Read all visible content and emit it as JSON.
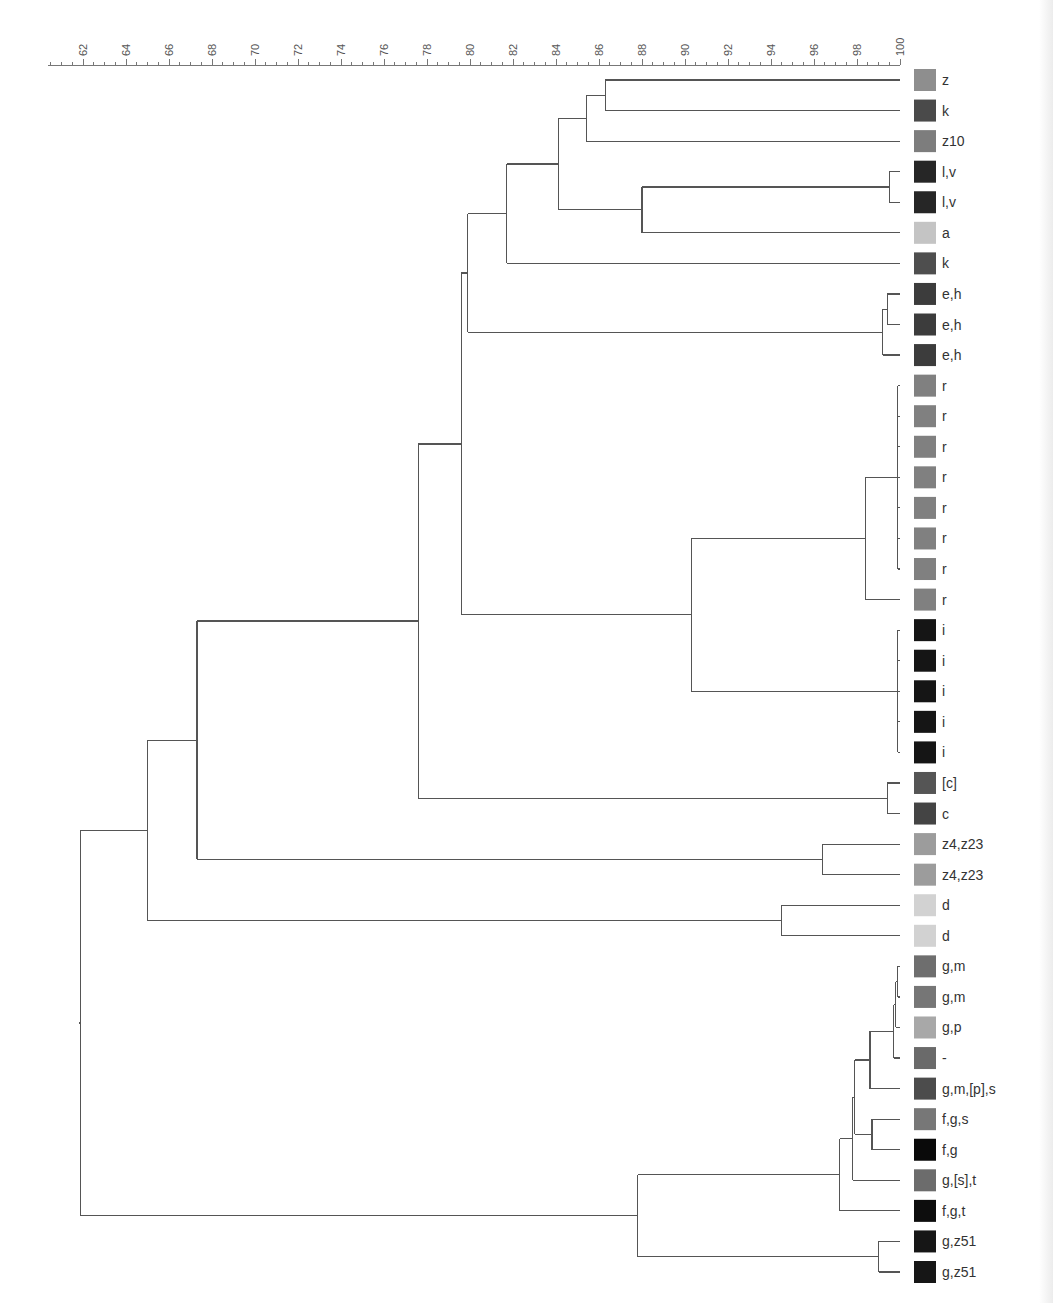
{
  "chart_data": {
    "type": "dendrogram",
    "title": "",
    "xlabel": "",
    "ylabel": "",
    "axis": {
      "min": 62,
      "max": 100,
      "major_ticks": [
        62,
        64,
        66,
        68,
        70,
        72,
        74,
        76,
        78,
        80,
        82,
        84,
        86,
        88,
        90,
        92,
        94,
        96,
        98,
        100
      ],
      "minor_step": 0.5,
      "position": "top",
      "label_rotation": -90
    },
    "grid": false,
    "legend": "color swatches beside leaf labels",
    "leaves": [
      {
        "label": "z",
        "color": "#8e8e8e"
      },
      {
        "label": "k",
        "color": "#4a4a4a"
      },
      {
        "label": "z10",
        "color": "#7d7d7d"
      },
      {
        "label": "l,v",
        "color": "#262626"
      },
      {
        "label": "l,v",
        "color": "#262626"
      },
      {
        "label": "a",
        "color": "#c4c4c4"
      },
      {
        "label": "k",
        "color": "#4e4e4e"
      },
      {
        "label": "e,h",
        "color": "#3c3c3c"
      },
      {
        "label": "e,h",
        "color": "#3c3c3c"
      },
      {
        "label": "e,h",
        "color": "#3c3c3c"
      },
      {
        "label": "r",
        "color": "#808080"
      },
      {
        "label": "r",
        "color": "#808080"
      },
      {
        "label": "r",
        "color": "#808080"
      },
      {
        "label": "r",
        "color": "#808080"
      },
      {
        "label": "r",
        "color": "#808080"
      },
      {
        "label": "r",
        "color": "#808080"
      },
      {
        "label": "r",
        "color": "#808080"
      },
      {
        "label": "r",
        "color": "#808080"
      },
      {
        "label": "i",
        "color": "#151515"
      },
      {
        "label": "i",
        "color": "#151515"
      },
      {
        "label": "i",
        "color": "#151515"
      },
      {
        "label": "i",
        "color": "#151515"
      },
      {
        "label": "i",
        "color": "#151515"
      },
      {
        "label": "[c]",
        "color": "#555555"
      },
      {
        "label": "c",
        "color": "#444444"
      },
      {
        "label": "z4,z23",
        "color": "#9c9c9c"
      },
      {
        "label": "z4,z23",
        "color": "#9c9c9c"
      },
      {
        "label": "d",
        "color": "#d2d2d2"
      },
      {
        "label": "d",
        "color": "#d2d2d2"
      },
      {
        "label": "g,m",
        "color": "#6e6e6e"
      },
      {
        "label": "g,m",
        "color": "#767676"
      },
      {
        "label": "g,p",
        "color": "#a8a8a8"
      },
      {
        "label": "-",
        "color": "#6a6a6a"
      },
      {
        "label": "g,m,[p],s",
        "color": "#4c4c4c"
      },
      {
        "label": "f,g,s",
        "color": "#777777"
      },
      {
        "label": "f,g",
        "color": "#0a0a0a"
      },
      {
        "label": "g,[s],t",
        "color": "#6c6c6c"
      },
      {
        "label": "f,g,t",
        "color": "#0d0d0d"
      },
      {
        "label": "g,z51",
        "color": "#161616"
      },
      {
        "label": "g,z51",
        "color": "#161616"
      }
    ],
    "merges": [
      {
        "id": "n1",
        "children": [
          "L0",
          "L1"
        ],
        "similarity": 86.3
      },
      {
        "id": "n2",
        "children": [
          "n1",
          "L2"
        ],
        "similarity": 85.4
      },
      {
        "id": "n3",
        "children": [
          "L3",
          "L4"
        ],
        "similarity": 99.5
      },
      {
        "id": "n4",
        "children": [
          "n3",
          "L5"
        ],
        "similarity": 88.0
      },
      {
        "id": "n5",
        "children": [
          "n2",
          "n4"
        ],
        "similarity": 84.1
      },
      {
        "id": "n6",
        "children": [
          "n5",
          "L6"
        ],
        "similarity": 81.7
      },
      {
        "id": "n7",
        "children": [
          "L7",
          "L8"
        ],
        "similarity": 99.4
      },
      {
        "id": "n8",
        "children": [
          "n7",
          "L9"
        ],
        "similarity": 99.2
      },
      {
        "id": "n9",
        "children": [
          "n6",
          "n8"
        ],
        "similarity": 79.9
      },
      {
        "id": "n10",
        "children": [
          "L10",
          "L11",
          "L12",
          "L13",
          "L14",
          "L15",
          "L16"
        ],
        "similarity": 99.9
      },
      {
        "id": "n11",
        "children": [
          "n10",
          "L17"
        ],
        "similarity": 98.4
      },
      {
        "id": "n12",
        "children": [
          "L18",
          "L19",
          "L20",
          "L21",
          "L22"
        ],
        "similarity": 99.9
      },
      {
        "id": "n13",
        "children": [
          "n11",
          "n12"
        ],
        "similarity": 90.3
      },
      {
        "id": "n14",
        "children": [
          "n9",
          "n13"
        ],
        "similarity": 79.6
      },
      {
        "id": "n15",
        "children": [
          "L23",
          "L24"
        ],
        "similarity": 99.4
      },
      {
        "id": "n16",
        "children": [
          "n14",
          "n15"
        ],
        "similarity": 77.6
      },
      {
        "id": "n17",
        "children": [
          "L25",
          "L26"
        ],
        "similarity": 96.4
      },
      {
        "id": "n18",
        "children": [
          "n16",
          "n17"
        ],
        "similarity": 67.3
      },
      {
        "id": "n19",
        "children": [
          "L27",
          "L28"
        ],
        "similarity": 94.5
      },
      {
        "id": "n20",
        "children": [
          "n18",
          "n19"
        ],
        "similarity": 65.0
      },
      {
        "id": "n21",
        "children": [
          "L29",
          "L30"
        ],
        "similarity": 99.9
      },
      {
        "id": "n22",
        "children": [
          "n21",
          "L31"
        ],
        "similarity": 99.8
      },
      {
        "id": "n23",
        "children": [
          "n22",
          "L32"
        ],
        "similarity": 99.7
      },
      {
        "id": "n24",
        "children": [
          "n23",
          "L33"
        ],
        "similarity": 98.6
      },
      {
        "id": "n25",
        "children": [
          "L34",
          "L35"
        ],
        "similarity": 98.7
      },
      {
        "id": "n26",
        "children": [
          "n24",
          "n25"
        ],
        "similarity": 97.9
      },
      {
        "id": "n27",
        "children": [
          "n26",
          "L36"
        ],
        "similarity": 97.8
      },
      {
        "id": "n28",
        "children": [
          "n27",
          "L37"
        ],
        "similarity": 97.2
      },
      {
        "id": "n29",
        "children": [
          "L38",
          "L39"
        ],
        "similarity": 99.0
      },
      {
        "id": "n30",
        "children": [
          "n28",
          "n29"
        ],
        "similarity": 87.8
      },
      {
        "id": "root",
        "children": [
          "n20",
          "n30"
        ],
        "similarity": 61.9
      }
    ]
  },
  "layout": {
    "axis_y": 65,
    "x_at_62": 83,
    "x_at_100": 900,
    "first_leaf_y": 80,
    "last_leaf_y": 1272,
    "axis_left_x": 48,
    "swatch_x": 914,
    "swatch_size": 22,
    "label_x": 942
  }
}
